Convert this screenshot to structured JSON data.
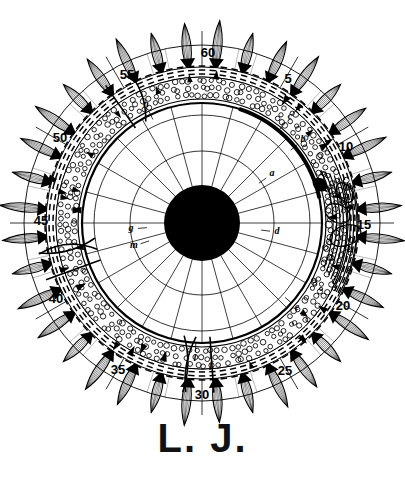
{
  "figure": {
    "signature": "L. J.",
    "center": {
      "x": 202,
      "y": 223
    },
    "background_color": "#ffffff",
    "ink_color": "#000000",
    "nucleus": {
      "radius": 38,
      "fill": "#000000",
      "name": "central nucleus"
    },
    "rings": [
      {
        "name": "inner-circle",
        "radius": 72,
        "style": "thin"
      },
      {
        "name": "mid-circle",
        "radius": 108,
        "style": "thin"
      },
      {
        "name": "capsule-wall",
        "radius": 120,
        "style": "medium"
      },
      {
        "name": "stipple-ring-inner",
        "radius": 124,
        "style": "thin"
      },
      {
        "name": "stipple-ring-outer",
        "radius": 146,
        "style": "thin"
      },
      {
        "name": "dash-ring-outer",
        "radius": 156,
        "style": "thin"
      },
      {
        "name": "tick-circle",
        "radius": 178,
        "style": "thin"
      }
    ],
    "spoke_count": 24,
    "spike_count": 36,
    "spike_length": 44,
    "spike_half_width": 9,
    "tick_labels": [
      {
        "value": "5",
        "angle_deg": 30,
        "x": 288,
        "y": 80
      },
      {
        "value": "10",
        "angle_deg": 60,
        "x": 346,
        "y": 148
      },
      {
        "value": "15",
        "angle_deg": 90,
        "x": 364,
        "y": 226
      },
      {
        "value": "20",
        "angle_deg": 120,
        "x": 343,
        "y": 307
      },
      {
        "value": "25",
        "angle_deg": 150,
        "x": 285,
        "y": 372
      },
      {
        "value": "30",
        "angle_deg": 180,
        "x": 202,
        "y": 396
      },
      {
        "value": "35",
        "angle_deg": 210,
        "x": 118,
        "y": 371
      },
      {
        "value": "40",
        "angle_deg": 240,
        "x": 56,
        "y": 300
      },
      {
        "value": "45",
        "angle_deg": 270,
        "x": 41,
        "y": 222
      },
      {
        "value": "50",
        "angle_deg": 300,
        "x": 60,
        "y": 139
      },
      {
        "value": "55",
        "angle_deg": 330,
        "x": 127,
        "y": 76
      },
      {
        "value": "60",
        "angle_deg": 0,
        "x": 208,
        "y": 54
      }
    ],
    "letter_labels": [
      {
        "value": "a",
        "x": 272,
        "y": 174
      },
      {
        "value": "b",
        "x": 303,
        "y": 140
      },
      {
        "value": "c",
        "x": 290,
        "y": 117
      },
      {
        "value": "d",
        "x": 277,
        "y": 232
      },
      {
        "value": "e",
        "x": 297,
        "y": 308
      },
      {
        "value": "f",
        "x": 211,
        "y": 366
      },
      {
        "value": "g",
        "x": 131,
        "y": 229
      },
      {
        "value": "l",
        "x": 195,
        "y": 359
      },
      {
        "value": "m",
        "x": 134,
        "y": 246
      },
      {
        "value": "n",
        "x": 146,
        "y": 105
      }
    ]
  }
}
